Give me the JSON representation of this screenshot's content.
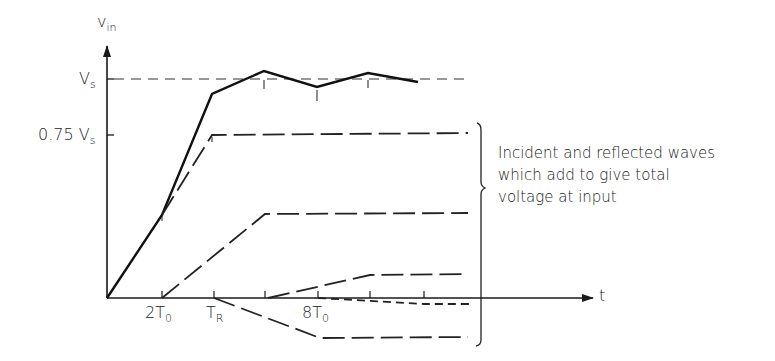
{
  "diagram": {
    "y_axis_label": {
      "main": "v",
      "sub": "in"
    },
    "x_axis_label": "t",
    "y_ticks": [
      {
        "main": "V",
        "sub": "s",
        "level": "Vs"
      },
      {
        "main": "0.75 V",
        "sub": "s",
        "level": "0.75Vs"
      }
    ],
    "x_ticks": [
      {
        "main": "2T",
        "sub": "0"
      },
      {
        "main": "T",
        "sub": "R"
      },
      {
        "main": "8T",
        "sub": "0"
      }
    ],
    "annotation": {
      "lines": [
        "Incident and reflected waves",
        "which add to give total",
        "voltage at input"
      ]
    },
    "curves": [
      {
        "name": "total-input-voltage",
        "style": "solid"
      },
      {
        "name": "incident-wave-1",
        "style": "long-dash",
        "plateau": "0.75Vs"
      },
      {
        "name": "reflected-wave-2",
        "style": "long-dash"
      },
      {
        "name": "reflected-wave-3",
        "style": "long-dash"
      },
      {
        "name": "reflected-wave-4",
        "style": "short-dash"
      },
      {
        "name": "negative-wave",
        "style": "long-dash"
      }
    ]
  }
}
